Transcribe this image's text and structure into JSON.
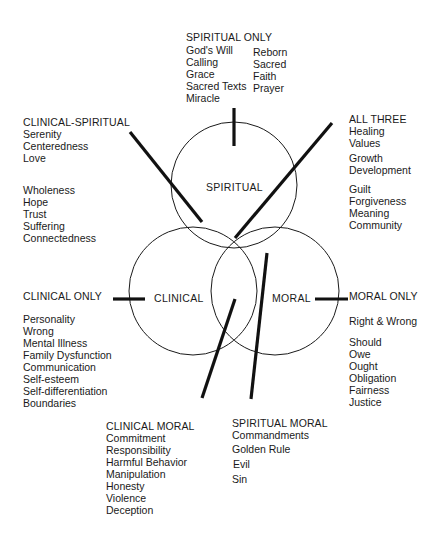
{
  "colors": {
    "ink": "#1a1a1a",
    "background": "#ffffff"
  },
  "circles": {
    "spiritual": {
      "label": "SPIRITUAL",
      "cx": 234,
      "cy": 185,
      "r": 63
    },
    "clinical": {
      "label": "CLINICAL",
      "cx": 193,
      "cy": 291,
      "r": 64
    },
    "moral": {
      "label": "MORAL",
      "cx": 275,
      "cy": 291,
      "r": 64
    }
  },
  "groups": {
    "spiritual_only": {
      "header": "SPIRITUAL ONLY",
      "col1": [
        "God's Will",
        "Calling",
        "Grace",
        "Sacred Texts",
        "Miracle"
      ],
      "col2": [
        "Reborn",
        "Sacred",
        "Faith",
        "Prayer"
      ]
    },
    "clinical_spiritual": {
      "header": "CLINICAL-SPIRITUAL",
      "items_a": [
        "Serenity",
        "Centeredness",
        "Love"
      ],
      "items_b": [
        "Wholeness",
        "Hope",
        "Trust",
        "Suffering",
        "Connectedness"
      ]
    },
    "all_three": {
      "header": "ALL THREE",
      "items_a": [
        "Healing",
        "Values"
      ],
      "items_b": [
        "Growth",
        "Development"
      ],
      "items_c": [
        "Guilt",
        "Forgiveness",
        "Meaning",
        "Community"
      ]
    },
    "clinical_only": {
      "header": "CLINICAL ONLY",
      "items_a": [
        "Personality",
        "Wrong",
        "Mental Illness",
        "Family Dysfunction",
        "Communication",
        "Self-esteem",
        "Self-differentiation",
        "Boundaries"
      ]
    },
    "moral_only": {
      "header": "MORAL ONLY",
      "items_a": [
        "Right & Wrong"
      ],
      "items_b": [
        "Should",
        "Owe",
        "Ought",
        "Obligation",
        "Fairness",
        "Justice"
      ]
    },
    "clinical_moral": {
      "header": "CLINICAL MORAL",
      "items_a": [
        "Commitment",
        "Responsibility",
        "Harmful Behavior",
        "Manipulation",
        "Honesty",
        "Violence",
        "Deception"
      ]
    },
    "spiritual_moral": {
      "header": "SPIRITUAL MORAL",
      "items_a": [
        "Commandments",
        "Golden Rule",
        "Evil",
        "Sin"
      ]
    }
  }
}
